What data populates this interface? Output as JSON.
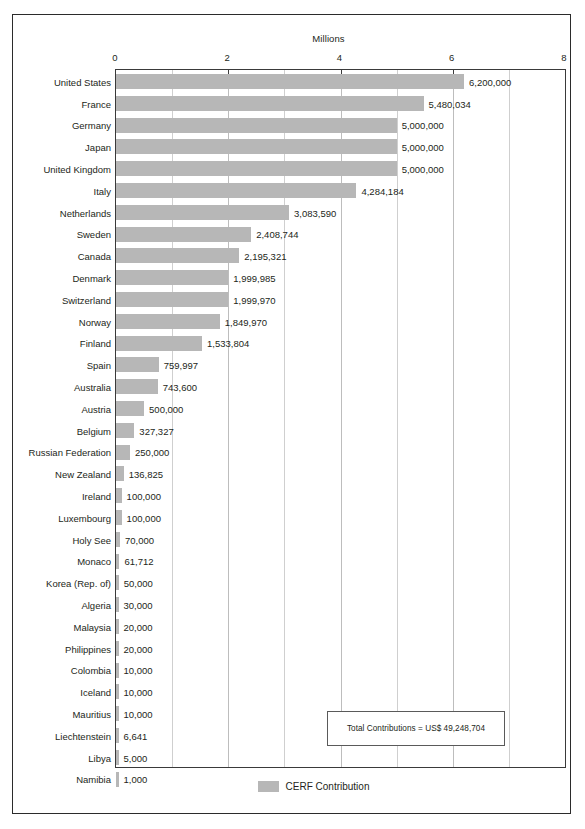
{
  "figure": {
    "axis_title": "Millions",
    "annotation": "Total Contributions = US$ 49,248,704",
    "legend_label": "CERF Contribution",
    "legend_swatch_name": "legend-color-swatch",
    "bar_color": "#b7b7b7",
    "frame_color": "#2b2b2b",
    "gridline_color": "#cfcfcf"
  },
  "chart_data": {
    "type": "bar",
    "orientation": "horizontal",
    "title": "",
    "xlabel": "Millions",
    "ylabel": "",
    "xlim": [
      0,
      8000000
    ],
    "xtick_labels": [
      "0",
      "2",
      "4",
      "6",
      "8"
    ],
    "xtick_values": [
      0,
      2000000,
      4000000,
      6000000,
      8000000
    ],
    "minor_gridline_step": 1000000,
    "grid": true,
    "legend": [
      "CERF Contribution"
    ],
    "legend_position": "bottom-center",
    "annotations": [
      "Total Contributions = US$ 49,248,704"
    ],
    "categories": [
      "United States",
      "France",
      "Germany",
      "Japan",
      "United Kingdom",
      "Italy",
      "Netherlands",
      "Sweden",
      "Canada",
      "Denmark",
      "Switzerland",
      "Norway",
      "Finland",
      "Spain",
      "Australia",
      "Austria",
      "Belgium",
      "Russian Federation",
      "New Zealand",
      "Ireland",
      "Luxembourg",
      "Holy See",
      "Monaco",
      "Korea (Rep. of)",
      "Algeria",
      "Malaysia",
      "Philippines",
      "Colombia",
      "Iceland",
      "Mauritius",
      "Liechtenstein",
      "Libya",
      "Namibia"
    ],
    "values": [
      6200000,
      5480034,
      5000000,
      5000000,
      5000000,
      4284184,
      3083590,
      2408744,
      2195321,
      1999985,
      1999970,
      1849970,
      1533804,
      759997,
      743600,
      500000,
      327327,
      250000,
      136825,
      100000,
      100000,
      70000,
      61712,
      50000,
      30000,
      20000,
      20000,
      10000,
      10000,
      10000,
      6641,
      5000,
      1000
    ],
    "value_labels": [
      "6,200,000",
      "5,480,034",
      "5,000,000",
      "5,000,000",
      "5,000,000",
      "4,284,184",
      "3,083,590",
      "2,408,744",
      "2,195,321",
      "1,999,985",
      "1,999,970",
      "1,849,970",
      "1,533,804",
      "759,997",
      "743,600",
      "500,000",
      "327,327",
      "250,000",
      "136,825",
      "100,000",
      "100,000",
      "70,000",
      "61,712",
      "50,000",
      "30,000",
      "20,000",
      "20,000",
      "10,000",
      "10,000",
      "10,000",
      "6,641",
      "5,000",
      "1,000"
    ],
    "total": 49248704
  }
}
